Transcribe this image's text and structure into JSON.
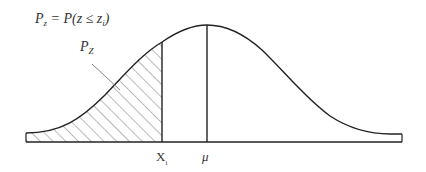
{
  "diagram": {
    "type": "normal-distribution-curve",
    "formula": {
      "lhs_main": "P",
      "lhs_sub": "z",
      "eq": " = P(z ≤ z",
      "rhs_sub": "i",
      "close": ")"
    },
    "area_label": {
      "main": "P",
      "sub": "Z"
    },
    "x_labels": {
      "x1_main": "X",
      "x1_sub": "i",
      "mu": "μ"
    },
    "shaded_region": "left tail up to X_i (hatched)",
    "colors": {
      "stroke": "#222222",
      "hatch": "#555555",
      "text": "#333333",
      "background": "#ffffff"
    }
  }
}
